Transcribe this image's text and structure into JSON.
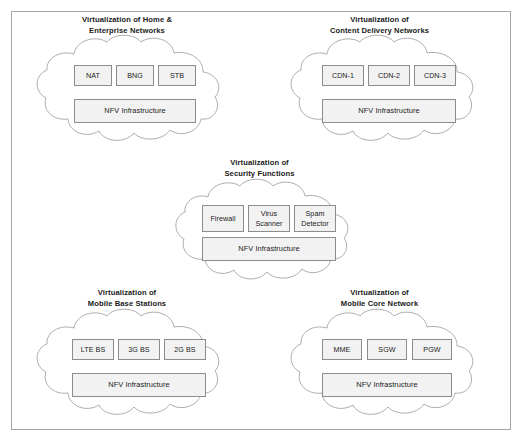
{
  "diagram": {
    "background_color": "#ffffff",
    "border_color": "#a6a6a6",
    "cloud_stroke_color": "#a3a3a3",
    "box_fill_color": "#f2f2f2",
    "box_border_color": "#8c8c8c",
    "text_color": "#1a1a1a",
    "nfvi_label": "NFV Infrastructure",
    "groups": [
      {
        "id": "home-enterprise-networks",
        "title": "Virtualization of Home &\nEnterprise Networks",
        "title_line1": "Virtualization of Home &",
        "title_line2": "Enterprise Networks",
        "functions": [
          {
            "id": "nat",
            "label": "NAT"
          },
          {
            "id": "bng",
            "label": "BNG"
          },
          {
            "id": "stb",
            "label": "STB"
          }
        ],
        "infrastructure": "NFV Infrastructure"
      },
      {
        "id": "content-delivery-networks",
        "title": "Virtualization of\nContent Delivery Networks",
        "title_line1": "Virtualization of",
        "title_line2": "Content Delivery Networks",
        "functions": [
          {
            "id": "cdn-1",
            "label": "CDN-1"
          },
          {
            "id": "cdn-2",
            "label": "CDN-2"
          },
          {
            "id": "cdn-3",
            "label": "CDN-3"
          }
        ],
        "infrastructure": "NFV Infrastructure"
      },
      {
        "id": "security-functions",
        "title": "Virtualization of\nSecurity Functions",
        "title_line1": "Virtualization of",
        "title_line2": "Security Functions",
        "functions": [
          {
            "id": "firewall",
            "label": "Firewall"
          },
          {
            "id": "virus-scanner",
            "label": "Virus\nScanner"
          },
          {
            "id": "spam-detector",
            "label": "Spam\nDetector"
          }
        ],
        "infrastructure": "NFV Infrastructure"
      },
      {
        "id": "mobile-base-stations",
        "title": "Virtualization of\nMobile Base Stations",
        "title_line1": "Virtualization of",
        "title_line2": "Mobile Base Stations",
        "functions": [
          {
            "id": "lte-bs",
            "label": "LTE BS"
          },
          {
            "id": "3g-bs",
            "label": "3G BS"
          },
          {
            "id": "2g-bs",
            "label": "2G BS"
          }
        ],
        "infrastructure": "NFV Infrastructure"
      },
      {
        "id": "mobile-core-network",
        "title": "Virtualization of\nMobile Core Network",
        "title_line1": "Virtualization of",
        "title_line2": "Mobile Core Network",
        "functions": [
          {
            "id": "mme",
            "label": "MME"
          },
          {
            "id": "sgw",
            "label": "SGW"
          },
          {
            "id": "pgw",
            "label": "PGW"
          }
        ],
        "infrastructure": "NFV Infrastructure"
      }
    ]
  }
}
